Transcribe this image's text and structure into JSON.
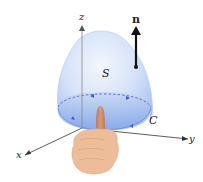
{
  "figure": {
    "labels": {
      "z_axis": "z",
      "x_axis": "x",
      "y_axis": "y",
      "normal": "n",
      "surface": "S",
      "curve": "C"
    },
    "colors": {
      "surface_light": "#e6effb",
      "surface_mid": "#b9cdf3",
      "surface_base": "#8fb0ec",
      "curve_dash": "#3a5fc8",
      "axis": "#333333",
      "hand": "#e9b48f",
      "thumb": "#c98b6a"
    }
  }
}
